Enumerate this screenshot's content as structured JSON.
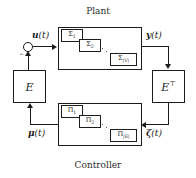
{
  "diagram": {
    "title_top": "Plant",
    "title_bottom": "Controller"
  },
  "blocks": {
    "plant": {
      "name": "Plant",
      "subsystems": [
        {
          "base": "Σ",
          "subscript": "1",
          "label": "Σ1"
        },
        {
          "base": "Σ",
          "subscript": "2",
          "label": "Σ2"
        },
        {
          "base": "Σ",
          "subscript": "|V|",
          "label": "Σ|V|"
        }
      ]
    },
    "controller": {
      "name": "Controller",
      "subsystems": [
        {
          "base": "Π",
          "subscript": "1",
          "label": "Π1"
        },
        {
          "base": "Π",
          "subscript": "2",
          "label": "Π2"
        },
        {
          "base": "Π",
          "subscript": "|E|",
          "label": "Π|E|"
        }
      ]
    },
    "incidence": {
      "label": "E"
    },
    "incidence_transpose": {
      "base": "E",
      "superscript": "⊤"
    }
  },
  "signals": {
    "input": {
      "sym": "u",
      "arg": "(t)"
    },
    "output": {
      "sym": "y",
      "arg": "(t)"
    },
    "controller_output": {
      "sym": "μ",
      "arg": "(t)"
    },
    "controller_input": {
      "sym": "ζ",
      "arg": "(t)"
    }
  },
  "junction": {
    "name": "summing-junction",
    "sign": "−"
  },
  "colors": {
    "stroke": "#1c1c1c",
    "text": "#2b2b2b",
    "background": "#ffffff",
    "dots": "#5a5a5a"
  }
}
